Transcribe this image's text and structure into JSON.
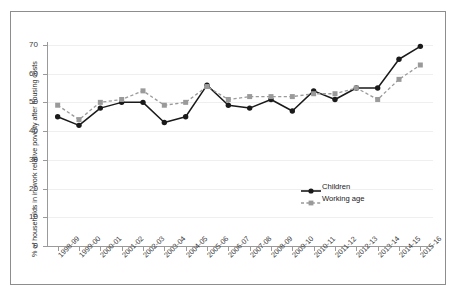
{
  "chart_data": {
    "type": "line",
    "title": "",
    "xlabel": "",
    "ylabel": "% of households in in-work relative poverty after housing costs",
    "ylim": [
      0,
      72
    ],
    "yticks": [
      0,
      10,
      20,
      30,
      40,
      50,
      60,
      70
    ],
    "grid": true,
    "legend_position": "inside-right",
    "categories": [
      "1998-99",
      "1999-00",
      "2000-01",
      "2001-02",
      "2002-03",
      "2003-04",
      "2004-05",
      "2005-06",
      "2006-07",
      "2007-08",
      "2008-09",
      "2009-10",
      "2010-11",
      "2011-12",
      "2012-13",
      "2013-14",
      "2014-15",
      "2015-16"
    ],
    "series": [
      {
        "name": "Children",
        "color": "#1a1a1a",
        "style": "solid",
        "marker": "circle",
        "values": [
          45,
          42,
          48,
          50,
          50,
          43,
          45,
          56,
          49,
          48,
          51,
          47,
          54,
          51,
          55,
          55,
          65,
          69.5
        ]
      },
      {
        "name": "Working age",
        "color": "#9a9a9a",
        "style": "dashed",
        "marker": "square",
        "values": [
          49,
          44,
          50,
          51,
          54,
          49,
          50,
          55.5,
          51,
          52,
          52,
          52,
          53,
          53,
          55,
          51,
          58,
          63
        ]
      }
    ]
  },
  "legend": {
    "items": [
      {
        "label": "Children"
      },
      {
        "label": "Working age"
      }
    ]
  }
}
